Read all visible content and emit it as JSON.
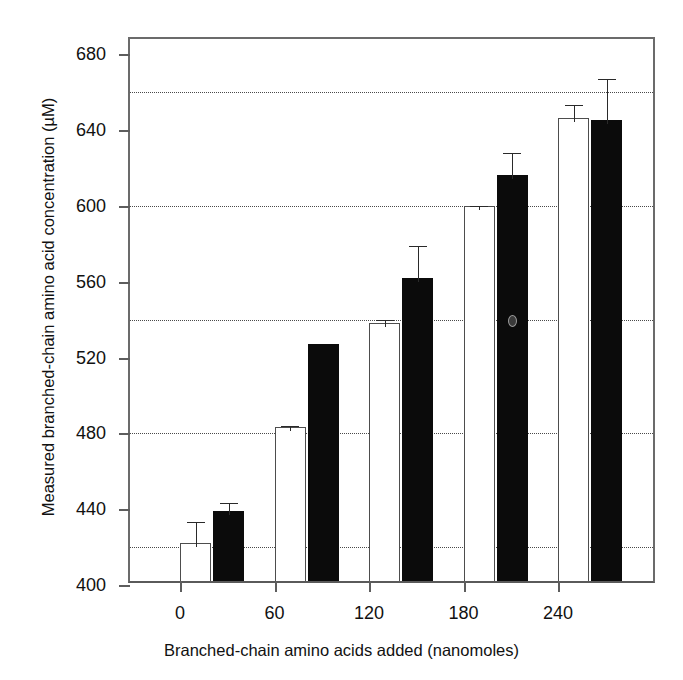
{
  "chart_data": {
    "type": "bar",
    "title": "",
    "xlabel": "Branched-chain amino acids added (nanomoles)",
    "ylabel": "Measured branched-chain amino acid concentration (µM)",
    "categories": [
      "0",
      "60",
      "120",
      "180",
      "240"
    ],
    "x": [
      0,
      60,
      120,
      180,
      240
    ],
    "series": [
      {
        "name": "open",
        "fill": "white",
        "values": [
          420,
          481,
          536,
          598,
          644
        ],
        "errors": [
          13,
          3,
          4,
          2,
          9
        ]
      },
      {
        "name": "filled",
        "fill": "black",
        "values": [
          437,
          525,
          560,
          614,
          643
        ],
        "errors": [
          6,
          0,
          19,
          14,
          24
        ]
      }
    ],
    "ylim": [
      400,
      688
    ],
    "yticks": [
      400,
      440,
      480,
      520,
      560,
      600,
      640,
      680
    ],
    "ytick_labels": [
      "400",
      "440",
      "480",
      "520",
      "560",
      "600",
      "640",
      "680"
    ],
    "gridlines": [
      420,
      480,
      540,
      600,
      660
    ],
    "grid": true,
    "grid_style": "dotted",
    "grid_axis": "y",
    "legend": "none",
    "error_bar_style": "upper-only",
    "colors": {
      "open_bar_fill": "#ffffff",
      "open_bar_edge": "#4d4d4d",
      "filled_bar_fill": "#0b0b0b",
      "axis": "#5d5d5d",
      "grid": "#4a4a4a",
      "text": "#111111",
      "background": "#ffffff"
    }
  },
  "annotations": {
    "speck_label": "scan-artifact-speck"
  }
}
